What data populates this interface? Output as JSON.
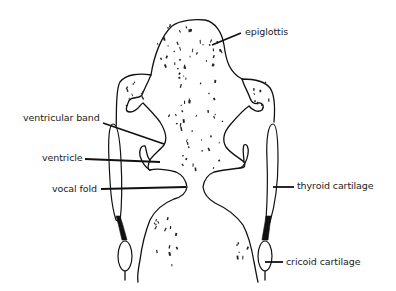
{
  "figure": {
    "labels": {
      "epiglottis": "epiglottis",
      "ventricular_band": "ventricular band",
      "ventricle": "ventricle",
      "vocal_fold": "vocal fold",
      "thyroid_cartilage": "thyroid cartilage",
      "cricoid_cartilage": "cricoid cartilage"
    },
    "colors": {
      "line": "#111111",
      "text": "#222222",
      "background": "#ffffff"
    }
  }
}
